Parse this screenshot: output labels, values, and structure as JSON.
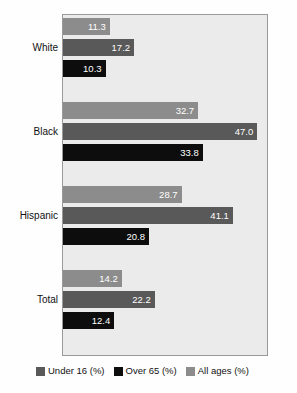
{
  "chart_data": {
    "type": "bar",
    "orientation": "horizontal",
    "title": "",
    "subtitle": "",
    "xlabel": "",
    "ylabel": "",
    "categories": [
      "White",
      "Black",
      "Hispanic",
      "Total"
    ],
    "series": [
      {
        "name": "All ages (%)",
        "color": "#8c8c8c",
        "values": [
          11.3,
          32.7,
          28.7,
          14.2
        ],
        "labels": [
          "11.3",
          "32.7",
          "28.7",
          "14.2"
        ]
      },
      {
        "name": "Under 16 (%)",
        "color": "#595959",
        "values": [
          17.2,
          47.0,
          41.1,
          22.2
        ],
        "labels": [
          "17.2",
          "47.0",
          "41.1",
          "22.2"
        ]
      },
      {
        "name": "Over 65 (%)",
        "color": "#0d0d0d",
        "values": [
          10.3,
          33.8,
          20.8,
          12.4
        ],
        "labels": [
          "10.3",
          "33.8",
          "20.8",
          "12.4"
        ]
      }
    ],
    "series_draw_order": [
      "All ages (%)",
      "Under 16 (%)",
      "Over 65 (%)"
    ],
    "xlim": [
      0,
      50
    ],
    "grid": false,
    "legend_position": "bottom",
    "legend": [
      {
        "label": "Under 16 (%)",
        "color": "#595959"
      },
      {
        "label": "Over 65 (%)",
        "color": "#0d0d0d"
      },
      {
        "label": "All ages (%)",
        "color": "#8c8c8c"
      }
    ],
    "plot_background": "#ebebeb",
    "plot_border": "#9a9a9a",
    "value_label_color": "#ffffff"
  }
}
